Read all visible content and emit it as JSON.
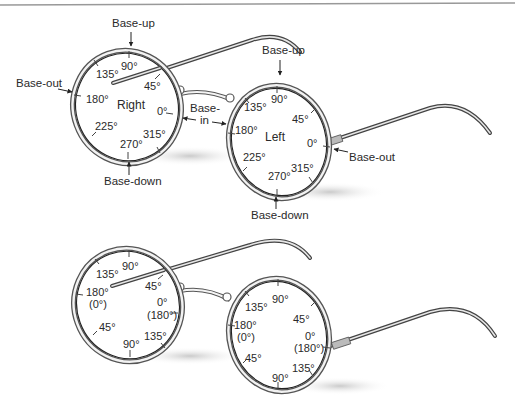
{
  "figure": {
    "top_pair": {
      "right_lens": {
        "name": "Right",
        "degrees": {
          "d90": "90°",
          "d135": "135°",
          "d45": "45°",
          "d180": "180°",
          "d0": "0°",
          "d225": "225°",
          "d315": "315°",
          "d270": "270°"
        },
        "base_up": "Base-up",
        "base_out": "Base-out",
        "base_down": "Base-down"
      },
      "bridge": {
        "base_in_line1": "Base-",
        "base_in_line2": "in"
      },
      "left_lens": {
        "name": "Left",
        "degrees": {
          "d90": "90°",
          "d135": "135°",
          "d45": "45°",
          "d180": "180°",
          "d0": "0°",
          "d225": "225°",
          "d315": "315°",
          "d270": "270°"
        },
        "base_up": "Base-up",
        "base_out": "Base-out",
        "base_down": "Base-down"
      }
    },
    "bottom_pair": {
      "right_lens": {
        "labels": {
          "d90_top": "90°",
          "d135_top": "135°",
          "d45_top": "45°",
          "d180": "180°",
          "d180_alt": "(0°)",
          "d0": "0°",
          "d0_alt": "(180°)",
          "d45_bottom": "45°",
          "d90_bottom": "90°",
          "d135_bottom": "135°"
        }
      },
      "left_lens": {
        "labels": {
          "d90_top": "90°",
          "d135_top": "135°",
          "d45_top": "45°",
          "d180": "180°",
          "d180_alt": "(0°)",
          "d0": "0°",
          "d0_alt": "(180°)",
          "d45_bottom": "45°",
          "d90_bottom": "90°",
          "d135_bottom": "135°"
        }
      }
    }
  }
}
